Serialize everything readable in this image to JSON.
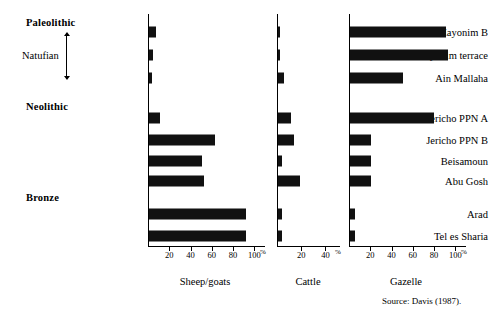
{
  "chart_data": {
    "type": "bar",
    "orientation": "horizontal",
    "title": "",
    "subtitle": "",
    "xlabel": "%",
    "ylabel": "",
    "grid": false,
    "legend": "none",
    "source": "Source: Davis (1987).",
    "categories": [
      "Hayonim B",
      "Hayonim terrace",
      "Ain Mallaha",
      "Jericho PPN A",
      "Jericho PPN B",
      "Beisamoun",
      "Abu Gosh",
      "Arad",
      "Tel es Sharia"
    ],
    "category_groups": [
      {
        "label": "Paleolithic",
        "bold": true,
        "members": []
      },
      {
        "label": "Natufian",
        "bold": false,
        "members": [
          "Hayonim B",
          "Hayonim terrace",
          "Ain Mallaha"
        ]
      },
      {
        "label": "Neolithic",
        "bold": true,
        "members": [
          "Jericho PPN A",
          "Jericho PPN B",
          "Beisamoun",
          "Abu Gosh"
        ]
      },
      {
        "label": "Bronze",
        "bold": true,
        "members": [
          "Arad",
          "Tel es Sharia"
        ]
      }
    ],
    "panels": [
      {
        "name": "Sheep/goats",
        "xlim": [
          0,
          110
        ],
        "ticks": [
          20,
          40,
          60,
          80,
          100
        ],
        "tick_labels": [
          "20",
          "40",
          "60",
          "80",
          "100"
        ],
        "unit": "%",
        "values": [
          7,
          4,
          3,
          10,
          62,
          50,
          52,
          91,
          91
        ]
      },
      {
        "name": "Cattle",
        "xlim": [
          0,
          52
        ],
        "ticks": [
          20,
          40
        ],
        "tick_labels": [
          "20",
          "40"
        ],
        "unit": "%",
        "values": [
          2,
          2,
          5,
          11,
          13,
          3,
          18,
          3,
          3
        ]
      },
      {
        "name": "Gazelle",
        "xlim": [
          0,
          110
        ],
        "ticks": [
          20,
          40,
          60,
          80,
          100
        ],
        "tick_labels": [
          "20",
          "40",
          "60",
          "80",
          "100"
        ],
        "unit": "%",
        "values": [
          90,
          92,
          50,
          79,
          20,
          20,
          20,
          5,
          5
        ]
      }
    ]
  },
  "figure": {
    "source_note": "Source: Davis (1987)."
  }
}
